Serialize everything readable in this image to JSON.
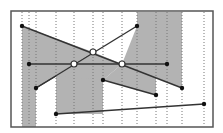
{
  "canvas": {
    "width": 223,
    "height": 133,
    "background": "#ffffff"
  },
  "frame": {
    "x": 11,
    "y": 11,
    "w": 202,
    "h": 116,
    "stroke": "#555555"
  },
  "colors": {
    "fill": "#b3b3b3",
    "line": "#333333",
    "dot": "#111111",
    "open": "#ffffff",
    "guide": "#777777"
  },
  "shaded_regions": [
    {
      "name": "left-wedge",
      "points": "22,26 93,52 74,64 36,88 36,127 22,127"
    },
    {
      "name": "center-band",
      "points": "56,76 103,80 103,52 93,52 74,64 56,76"
    },
    {
      "name": "mid-column",
      "points": "56,76 103,80 122,64 93,52"
    },
    {
      "name": "right-upper",
      "points": "137,11 182,11 182,88 122,64 137,26"
    },
    {
      "name": "right-lower",
      "points": "103,80 156,95 156,76 122,64"
    }
  ],
  "guides_x": [
    22,
    29,
    36,
    56,
    74,
    93,
    103,
    122,
    137,
    156,
    167,
    182,
    204
  ],
  "lines": [
    {
      "name": "descending-line",
      "x1": 22,
      "y1": 26,
      "x2": 182,
      "y2": 88
    },
    {
      "name": "ascending-line",
      "x1": 36,
      "y1": 88,
      "x2": 137,
      "y2": 26
    },
    {
      "name": "horizontal-line",
      "x1": 29,
      "y1": 64,
      "x2": 167,
      "y2": 64
    },
    {
      "name": "lower-slant-line",
      "x1": 103,
      "y1": 80,
      "x2": 156,
      "y2": 95
    },
    {
      "name": "bottom-line",
      "x1": 56,
      "y1": 114,
      "x2": 204,
      "y2": 104
    },
    {
      "name": "left-short-line",
      "x1": 36,
      "y1": 88,
      "x2": 56,
      "y2": 76
    }
  ],
  "filled_points": [
    {
      "x": 22,
      "y": 26
    },
    {
      "x": 137,
      "y": 26
    },
    {
      "x": 29,
      "y": 64
    },
    {
      "x": 167,
      "y": 64
    },
    {
      "x": 36,
      "y": 88
    },
    {
      "x": 103,
      "y": 80
    },
    {
      "x": 156,
      "y": 95
    },
    {
      "x": 182,
      "y": 88
    },
    {
      "x": 56,
      "y": 114
    },
    {
      "x": 204,
      "y": 104
    }
  ],
  "open_points": [
    {
      "x": 93,
      "y": 52
    },
    {
      "x": 74,
      "y": 64
    },
    {
      "x": 122,
      "y": 64
    }
  ]
}
